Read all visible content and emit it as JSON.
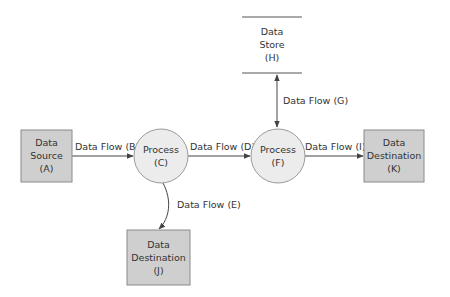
{
  "diagram": {
    "type": "data-flow-diagram",
    "colors": {
      "entity_fill": "#cfcfcf",
      "process_fill": "#ececec",
      "line": "#444444"
    },
    "nodes": {
      "A": {
        "kind": "external-entity",
        "lines": [
          "Data",
          "Source",
          "(A)"
        ]
      },
      "C": {
        "kind": "process",
        "lines": [
          "Process",
          "(C)"
        ]
      },
      "F": {
        "kind": "process",
        "lines": [
          "Process",
          "(F)"
        ]
      },
      "H": {
        "kind": "data-store",
        "lines": [
          "Data",
          "Store",
          "(H)"
        ]
      },
      "K": {
        "kind": "external-entity",
        "lines": [
          "Data",
          "Destination",
          "(K)"
        ]
      },
      "J": {
        "kind": "external-entity",
        "lines": [
          "Data",
          "Destination",
          "(J)"
        ]
      }
    },
    "edges": {
      "B": {
        "from": "A",
        "to": "C",
        "label": "Data Flow (B)",
        "direction": "forward"
      },
      "D": {
        "from": "C",
        "to": "F",
        "label": "Data Flow (D)",
        "direction": "forward"
      },
      "G": {
        "from": "H",
        "to": "F",
        "label": "Data Flow (G)",
        "direction": "both"
      },
      "I": {
        "from": "F",
        "to": "K",
        "label": "Data Flow (I)",
        "direction": "forward"
      },
      "E": {
        "from": "C",
        "to": "J",
        "label": "Data Flow (E)",
        "direction": "forward"
      }
    }
  }
}
